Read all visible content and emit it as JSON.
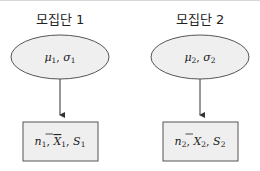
{
  "diagram": {
    "populations": [
      {
        "title": "모집단 1",
        "params": {
          "mu": "μ",
          "mu_sub": "1",
          "sep": ", ",
          "sigma": "σ",
          "sigma_sub": "1"
        },
        "sample": {
          "n": "n",
          "n_sub": "1",
          "xbar": "X",
          "xbar_sub": "1",
          "s": "S",
          "s_sub": "1",
          "sep": ", "
        }
      },
      {
        "title": "모집단 2",
        "params": {
          "mu": "μ",
          "mu_sub": "2",
          "sep": ", ",
          "sigma": "σ",
          "sigma_sub": "2"
        },
        "sample": {
          "n": "n",
          "n_sub": "2",
          "xbar": "X",
          "xbar_sub": "2",
          "s": "S",
          "s_sub": "2",
          "sep": ", "
        }
      }
    ],
    "colors": {
      "fill": "#efefef",
      "stroke": "#555555",
      "arrow": "#333333"
    }
  }
}
